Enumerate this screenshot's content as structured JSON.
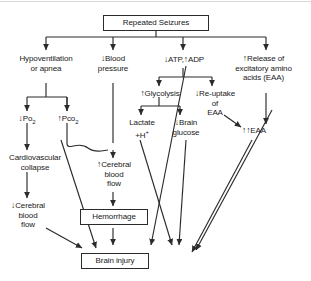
{
  "diagram": {
    "title": "Repeated Seizures",
    "type": "flowchart",
    "nodes": {
      "repeated_seizures": {
        "label": "Repeated Seizures",
        "shape": "box"
      },
      "hypoventilation": {
        "line1": "Hypoventilation",
        "line2": "or apnea",
        "shape": "plain"
      },
      "blood_pressure": {
        "arrow": "↓",
        "line1": "Blood",
        "line2": "pressure",
        "shape": "plain"
      },
      "atp_adp": {
        "arrow1": "↓",
        "text1": "ATP,",
        "arrow2": "↑",
        "text2": "ADP",
        "shape": "plain"
      },
      "release_eaa": {
        "arrow": "↑",
        "line1": "Release of",
        "line2": "excitatory amino",
        "line3": "acids (EAA)",
        "shape": "plain"
      },
      "po2": {
        "arrow": "↓",
        "text": "Po",
        "subscript": "2",
        "shape": "plain"
      },
      "pco2": {
        "arrow": "↑",
        "text": "Pco",
        "subscript": "2",
        "shape": "plain"
      },
      "glycolysis": {
        "arrow": "↑",
        "text": "Glycolysis",
        "shape": "plain"
      },
      "reuptake_eaa": {
        "arrow": "↓",
        "line1": "Re-uptake",
        "line2": "of",
        "line3": "EAA",
        "shape": "plain"
      },
      "lactate": {
        "arrow": "↑",
        "line1": "Lactate",
        "line2": "+H",
        "superscript": "+",
        "shape": "plain"
      },
      "brain_glucose": {
        "arrow": "↓",
        "line1": "Brain",
        "line2": "glucose",
        "shape": "plain"
      },
      "eaa_double": {
        "arrow": "↑↑",
        "text": "EAA",
        "shape": "plain"
      },
      "cardiovascular_collapse": {
        "line1": "Cardiovascular",
        "line2": "collapse",
        "shape": "plain"
      },
      "cerebral_blood_flow_up": {
        "arrow": "↑",
        "line1": "Cerebral",
        "line2": "blood",
        "line3": "flow",
        "shape": "plain"
      },
      "cerebral_blood_flow_down": {
        "arrow": "↓",
        "line1": "Cerebral",
        "line2": "blood",
        "line3": "flow",
        "shape": "plain"
      },
      "hemorrhage": {
        "label": "Hemorrhage",
        "shape": "box"
      },
      "brain_injury": {
        "label": "Brain injury",
        "shape": "box"
      }
    },
    "edges": [
      {
        "from": "repeated_seizures",
        "to": "hypoventilation"
      },
      {
        "from": "repeated_seizures",
        "to": "blood_pressure"
      },
      {
        "from": "repeated_seizures",
        "to": "atp_adp"
      },
      {
        "from": "repeated_seizures",
        "to": "release_eaa"
      },
      {
        "from": "hypoventilation",
        "to": "po2"
      },
      {
        "from": "hypoventilation",
        "to": "pco2"
      },
      {
        "from": "atp_adp",
        "to": "glycolysis"
      },
      {
        "from": "atp_adp",
        "to": "reuptake_eaa"
      },
      {
        "from": "atp_adp",
        "to": "brain_injury"
      },
      {
        "from": "glycolysis",
        "to": "lactate"
      },
      {
        "from": "glycolysis",
        "to": "brain_glucose"
      },
      {
        "from": "release_eaa",
        "to": "eaa_double"
      },
      {
        "from": "reuptake_eaa",
        "to": "eaa_double"
      },
      {
        "from": "po2",
        "to": "cardiovascular_collapse"
      },
      {
        "from": "pco2",
        "to": "cerebral_blood_flow_up"
      },
      {
        "from": "blood_pressure",
        "to": "cerebral_blood_flow_up"
      },
      {
        "from": "cardiovascular_collapse",
        "to": "cerebral_blood_flow_down"
      },
      {
        "from": "cerebral_blood_flow_up",
        "to": "hemorrhage"
      },
      {
        "from": "hemorrhage",
        "to": "brain_injury"
      },
      {
        "from": "cerebral_blood_flow_down",
        "to": "brain_injury"
      },
      {
        "from": "lactate",
        "to": "brain_injury"
      },
      {
        "from": "brain_glucose",
        "to": "brain_injury"
      },
      {
        "from": "eaa_double",
        "to": "brain_injury"
      }
    ],
    "colors": {
      "stroke": "#2b2b2b",
      "text": "#1a1a1a",
      "background": "#ffffff"
    }
  }
}
